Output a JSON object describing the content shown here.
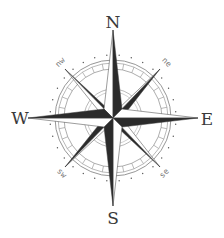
{
  "compass": {
    "labels": {
      "n": "N",
      "s": "S",
      "e": "E",
      "w": "W",
      "ne": "ne",
      "nw": "nw",
      "se": "se",
      "sw": "sw"
    },
    "colors": {
      "dark": "#2b2b2b",
      "light": "#ffffff",
      "stroke": "#3a3a3a",
      "ring": "#8a8a8a",
      "ticks": "#555555"
    }
  }
}
